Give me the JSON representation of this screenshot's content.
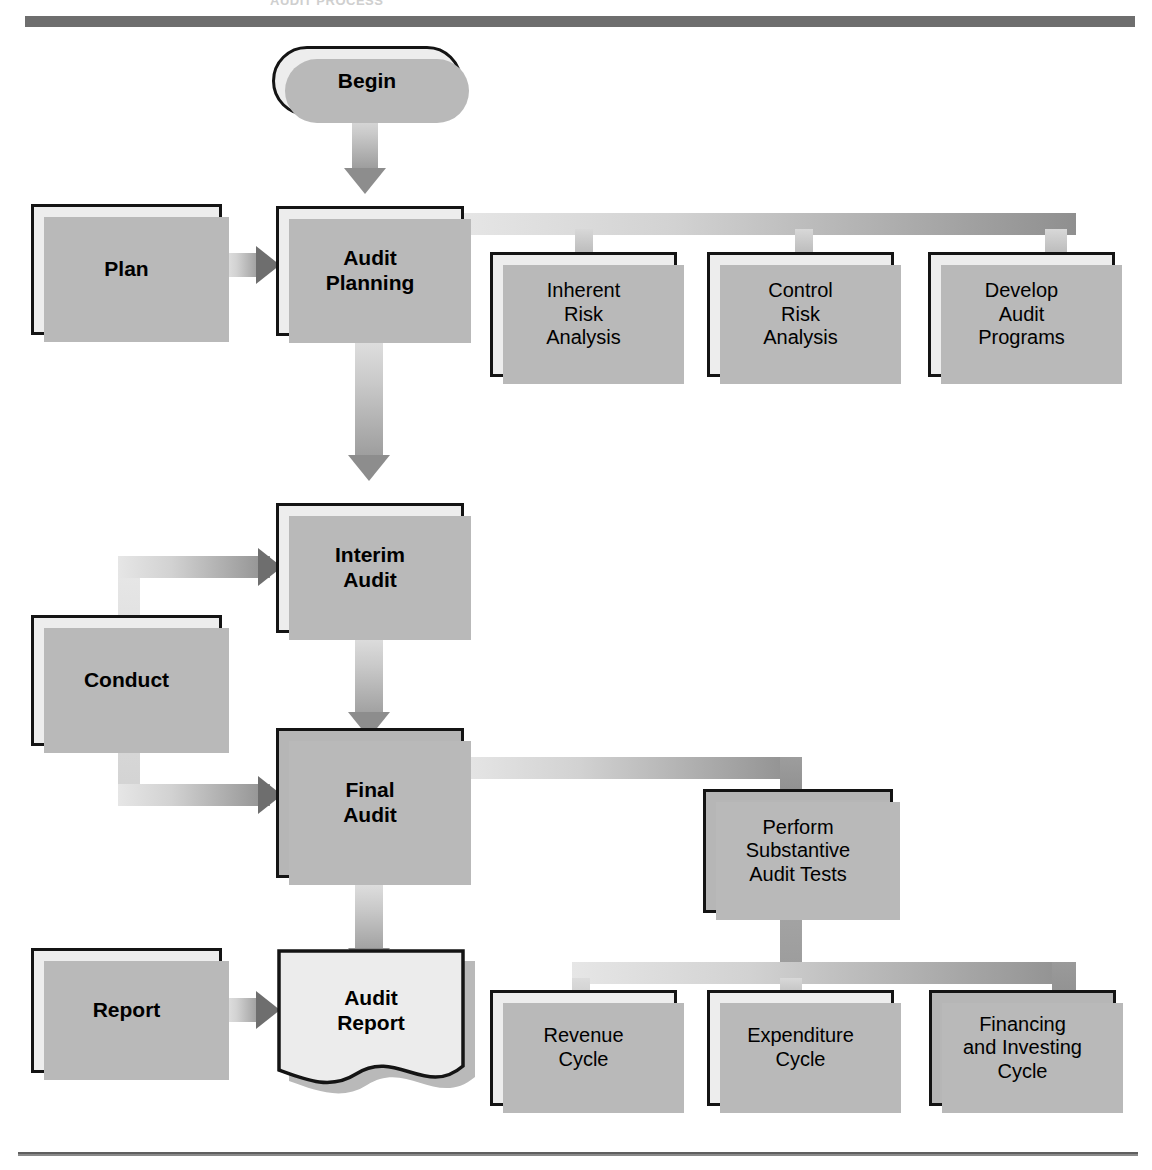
{
  "page": {
    "cropped_header_text": "AUDIT PROCESS"
  },
  "nodes": {
    "begin": {
      "label": "Begin",
      "shape": "terminator",
      "fill": "light",
      "emphasis": "bold"
    },
    "plan": {
      "label": "Plan",
      "shape": "process",
      "fill": "light",
      "emphasis": "bold"
    },
    "audit_planning": {
      "label": "Audit\nPlanning",
      "line1": "Audit",
      "line2": "Planning",
      "shape": "process",
      "fill": "light",
      "emphasis": "bold"
    },
    "inherent_risk": {
      "line1": "Inherent",
      "line2": "Risk",
      "line3": "Analysis",
      "shape": "process",
      "fill": "light",
      "emphasis": "plain"
    },
    "control_risk": {
      "line1": "Control",
      "line2": "Risk",
      "line3": "Analysis",
      "shape": "process",
      "fill": "light",
      "emphasis": "plain"
    },
    "develop_programs": {
      "line1": "Develop",
      "line2": "Audit",
      "line3": "Programs",
      "shape": "process",
      "fill": "light",
      "emphasis": "plain"
    },
    "conduct": {
      "label": "Conduct",
      "shape": "process",
      "fill": "light",
      "emphasis": "bold"
    },
    "interim_audit": {
      "line1": "Interim",
      "line2": "Audit",
      "shape": "process",
      "fill": "light",
      "emphasis": "bold"
    },
    "final_audit": {
      "line1": "Final",
      "line2": "Audit",
      "shape": "process",
      "fill": "dark",
      "emphasis": "bold"
    },
    "perform_substantive": {
      "line1": "Perform",
      "line2": "Substantive",
      "line3": "Audit Tests",
      "shape": "process",
      "fill": "dark",
      "emphasis": "plain"
    },
    "report": {
      "label": "Report",
      "shape": "process",
      "fill": "light",
      "emphasis": "bold"
    },
    "audit_report": {
      "line1": "Audit",
      "line2": "Report",
      "shape": "document",
      "fill": "light",
      "emphasis": "bold"
    },
    "revenue_cycle": {
      "line1": "Revenue",
      "line2": "Cycle",
      "shape": "process",
      "fill": "light",
      "emphasis": "plain"
    },
    "expenditure_cycle": {
      "line1": "Expenditure",
      "line2": "Cycle",
      "shape": "process",
      "fill": "light",
      "emphasis": "plain"
    },
    "financing_cycle": {
      "line1": "Financing",
      "line2": "and Investing",
      "line3": "Cycle",
      "shape": "process",
      "fill": "dark",
      "emphasis": "plain"
    }
  },
  "edges": [
    {
      "from": "begin",
      "to": "audit_planning",
      "style": "arrow-down"
    },
    {
      "from": "plan",
      "to": "audit_planning",
      "style": "arrow-right"
    },
    {
      "from": "audit_planning",
      "to": "inherent_risk",
      "style": "bus"
    },
    {
      "from": "audit_planning",
      "to": "control_risk",
      "style": "bus"
    },
    {
      "from": "audit_planning",
      "to": "develop_programs",
      "style": "bus"
    },
    {
      "from": "audit_planning",
      "to": "interim_audit",
      "style": "arrow-down"
    },
    {
      "from": "conduct",
      "to": "interim_audit",
      "style": "arrow-right-elbow"
    },
    {
      "from": "conduct",
      "to": "final_audit",
      "style": "arrow-right-elbow"
    },
    {
      "from": "interim_audit",
      "to": "final_audit",
      "style": "arrow-down"
    },
    {
      "from": "final_audit",
      "to": "perform_substantive",
      "style": "bus"
    },
    {
      "from": "final_audit",
      "to": "audit_report",
      "style": "arrow-down"
    },
    {
      "from": "report",
      "to": "audit_report",
      "style": "arrow-right"
    },
    {
      "from": "perform_substantive",
      "to": "revenue_cycle",
      "style": "bus"
    },
    {
      "from": "perform_substantive",
      "to": "expenditure_cycle",
      "style": "bus"
    },
    {
      "from": "perform_substantive",
      "to": "financing_cycle",
      "style": "bus"
    }
  ],
  "colors": {
    "box_fill_light": "#ececec",
    "box_fill_dark": "#b6b6b6",
    "box_border": "#141414",
    "shadow": "#b9b9b9",
    "connector_dark": "#8f8f8f",
    "connector_light": "#e6e6e6",
    "rule": "#6e6e6e"
  }
}
